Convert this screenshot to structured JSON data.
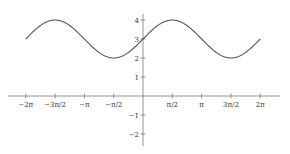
{
  "chart_data": {
    "type": "line",
    "title": "",
    "xlabel": "",
    "ylabel": "",
    "function": "y = 3 + sin(x)",
    "xlim": [
      -6.2832,
      6.2832
    ],
    "ylim": [
      -2,
      4
    ],
    "grid": false,
    "legend": null,
    "x_ticks": [
      {
        "value": -6.2832,
        "label": "−2π"
      },
      {
        "value": -4.7124,
        "label": "−3π/2"
      },
      {
        "value": -3.1416,
        "label": "−π"
      },
      {
        "value": -1.5708,
        "label": "−π/2"
      },
      {
        "value": 1.5708,
        "label": "π/2"
      },
      {
        "value": 3.1416,
        "label": "π"
      },
      {
        "value": 4.7124,
        "label": "3π/2"
      },
      {
        "value": 6.2832,
        "label": "2π"
      }
    ],
    "y_ticks": [
      {
        "value": 4,
        "label": "4"
      },
      {
        "value": 3,
        "label": "3"
      },
      {
        "value": 2,
        "label": "2"
      },
      {
        "value": 1,
        "label": "1"
      },
      {
        "value": -1,
        "label": "−1"
      },
      {
        "value": -2,
        "label": "−2"
      }
    ],
    "series": [
      {
        "name": "3 + sin(x)",
        "color": "#555555",
        "x": [
          -6.2832,
          -4.7124,
          -3.1416,
          -1.5708,
          0,
          1.5708,
          3.1416,
          4.7124,
          6.2832
        ],
        "values": [
          3,
          4,
          3,
          2,
          3,
          4,
          3,
          2,
          3
        ]
      }
    ]
  },
  "layout": {
    "origin_px": [
      143,
      96
    ],
    "px_per_unit_x": 18.66,
    "px_per_unit_y": 19.0,
    "x_axis_extent_px": [
      8,
      280
    ],
    "y_axis_extent_px": [
      14,
      146
    ]
  }
}
